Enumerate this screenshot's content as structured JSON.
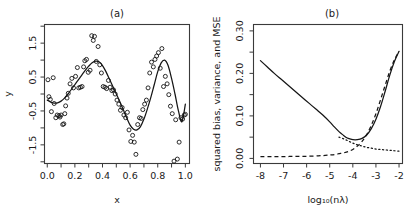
{
  "figure": {
    "panels": [
      {
        "id": "a",
        "title": "(a)",
        "xlabel": "x",
        "ylabel": "y"
      },
      {
        "id": "b",
        "title": "(b)",
        "xlabel": "log₁₀(nλ)",
        "ylabel": "squared bias, variance, and MSE"
      }
    ]
  },
  "chart_data": [
    {
      "type": "scatter",
      "panel": "a",
      "title": "(a)",
      "xlabel": "x",
      "ylabel": "y",
      "xlim": [
        -0.02,
        1.03
      ],
      "ylim": [
        -2.05,
        2.05
      ],
      "xticks": [
        0.0,
        0.2,
        0.4,
        0.6,
        0.8,
        1.0
      ],
      "xtick_labels": [
        "0.0",
        "0.2",
        "0.4",
        "0.6",
        "0.8",
        "1.0"
      ],
      "xminor_ticks": [
        0.1,
        0.3,
        0.5,
        0.7,
        0.9
      ],
      "yticks": [
        -1.5,
        -0.5,
        0.5,
        1.5
      ],
      "ytick_labels": [
        "-1.5",
        "-0.5",
        "0.5",
        "1.5"
      ],
      "yminor_ticks": [
        -2.0,
        -1.0,
        0.0,
        1.0,
        2.0
      ],
      "grid": false,
      "legend": null,
      "series": [
        {
          "name": "observations",
          "type": "scatter",
          "marker": "open-circle",
          "x": [
            0.005,
            0.012,
            0.022,
            0.03,
            0.043,
            0.05,
            0.062,
            0.072,
            0.085,
            0.092,
            0.1,
            0.112,
            0.12,
            0.127,
            0.133,
            0.143,
            0.152,
            0.165,
            0.178,
            0.19,
            0.205,
            0.218,
            0.228,
            0.24,
            0.252,
            0.263,
            0.272,
            0.284,
            0.297,
            0.31,
            0.322,
            0.333,
            0.342,
            0.355,
            0.368,
            0.38,
            0.392,
            0.405,
            0.418,
            0.43,
            0.443,
            0.455,
            0.468,
            0.48,
            0.492,
            0.505,
            0.518,
            0.53,
            0.542,
            0.555,
            0.568,
            0.58,
            0.592,
            0.605,
            0.618,
            0.63,
            0.642,
            0.655,
            0.668,
            0.68,
            0.692,
            0.705,
            0.718,
            0.73,
            0.742,
            0.755,
            0.768,
            0.78,
            0.792,
            0.805,
            0.818,
            0.83,
            0.842,
            0.855,
            0.868,
            0.88,
            0.892,
            0.905,
            0.918,
            0.93,
            0.942,
            0.955,
            0.968,
            0.98,
            0.992,
            1.0
          ],
          "y": [
            0.42,
            -0.08,
            -0.16,
            -0.52,
            0.48,
            -0.28,
            -0.7,
            -0.62,
            -0.64,
            -0.68,
            -0.62,
            -0.9,
            -0.88,
            -0.58,
            -0.35,
            -0.12,
            0.02,
            0.3,
            0.46,
            0.18,
            0.52,
            0.78,
            0.18,
            0.2,
            0.22,
            0.8,
            0.98,
            1.02,
            0.64,
            0.7,
            1.72,
            1.58,
            1.7,
            0.96,
            1.4,
            0.86,
            0.62,
            0.22,
            0.2,
            0.16,
            0.4,
            0.2,
            0.1,
            0.12,
            0.0,
            -0.18,
            -0.3,
            -0.48,
            -0.4,
            -0.62,
            -0.7,
            -0.54,
            -1.06,
            -1.4,
            -1.22,
            -1.42,
            -1.78,
            -0.9,
            -0.7,
            -0.72,
            -0.46,
            -0.3,
            -0.18,
            0.18,
            0.62,
            0.94,
            0.8,
            1.02,
            1.12,
            1.22,
            0.76,
            1.34,
            0.22,
            0.52,
            0.3,
            -0.02,
            -0.36,
            -0.58,
            -1.98,
            -0.76,
            -1.92,
            -1.42,
            -0.7,
            -0.74,
            -0.62,
            -0.6
          ]
        },
        {
          "name": "smoothing-spline-fit",
          "type": "line",
          "style": "solid",
          "x": [
            0.0,
            0.025,
            0.05,
            0.075,
            0.1,
            0.125,
            0.15,
            0.175,
            0.2,
            0.225,
            0.25,
            0.275,
            0.3,
            0.325,
            0.35,
            0.375,
            0.4,
            0.425,
            0.45,
            0.475,
            0.5,
            0.525,
            0.55,
            0.575,
            0.6,
            0.625,
            0.65,
            0.675,
            0.7,
            0.725,
            0.75,
            0.775,
            0.8,
            0.825,
            0.85,
            0.875,
            0.9,
            0.925,
            0.95,
            0.975,
            1.0
          ],
          "y": [
            -0.18,
            -0.24,
            -0.27,
            -0.26,
            -0.21,
            -0.12,
            0.0,
            0.14,
            0.28,
            0.42,
            0.56,
            0.7,
            0.82,
            0.92,
            0.97,
            0.95,
            0.84,
            0.66,
            0.44,
            0.22,
            0.0,
            -0.22,
            -0.46,
            -0.7,
            -0.92,
            -1.04,
            -1.06,
            -0.96,
            -0.74,
            -0.44,
            -0.1,
            0.28,
            0.66,
            0.92,
            1.0,
            0.84,
            0.46,
            0.0,
            -0.5,
            -0.82,
            -0.3
          ]
        }
      ]
    },
    {
      "type": "line",
      "panel": "b",
      "title": "(b)",
      "xlabel": "log₁₀(nλ)",
      "ylabel": "squared bias, variance, and MSE",
      "xlim": [
        -8.3,
        -1.85
      ],
      "ylim": [
        -0.012,
        0.315
      ],
      "xticks": [
        -8,
        -7,
        -6,
        -5,
        -4,
        -3,
        -2
      ],
      "xtick_labels": [
        "-8",
        "-7",
        "-6",
        "-5",
        "-4",
        "-3",
        "-2"
      ],
      "yticks": [
        0.0,
        0.1,
        0.2,
        0.3
      ],
      "ytick_labels": [
        "0.00",
        "0.10",
        "0.20",
        "0.30"
      ],
      "yminor_ticks": [
        0.05,
        0.15,
        0.25
      ],
      "grid": false,
      "legend": null,
      "series": [
        {
          "name": "MSE",
          "style": "solid",
          "x": [
            -8.0,
            -7.7,
            -7.4,
            -7.1,
            -6.8,
            -6.5,
            -6.2,
            -5.9,
            -5.6,
            -5.3,
            -5.0,
            -4.8,
            -4.6,
            -4.4,
            -4.3,
            -4.2,
            -4.0,
            -3.8,
            -3.6,
            -3.4,
            -3.2,
            -3.0,
            -2.8,
            -2.6,
            -2.4,
            -2.2,
            -2.0
          ],
          "y": [
            0.23,
            0.215,
            0.2,
            0.186,
            0.172,
            0.158,
            0.144,
            0.13,
            0.116,
            0.102,
            0.086,
            0.074,
            0.063,
            0.054,
            0.05,
            0.047,
            0.044,
            0.044,
            0.047,
            0.055,
            0.07,
            0.092,
            0.122,
            0.158,
            0.196,
            0.228,
            0.252
          ]
        },
        {
          "name": "squared bias",
          "style": "dashed",
          "x": [
            -8.0,
            -7.5,
            -7.0,
            -6.5,
            -6.0,
            -5.5,
            -5.2,
            -5.0,
            -4.8,
            -4.6,
            -4.4,
            -4.2,
            -4.0,
            -3.8,
            -3.6,
            -3.4,
            -3.2,
            -3.0,
            -2.8,
            -2.6,
            -2.4,
            -2.2,
            -2.0
          ],
          "y": [
            0.004,
            0.004,
            0.004,
            0.005,
            0.005,
            0.006,
            0.007,
            0.008,
            0.009,
            0.011,
            0.013,
            0.016,
            0.021,
            0.029,
            0.04,
            0.056,
            0.078,
            0.105,
            0.138,
            0.172,
            0.205,
            0.232,
            0.252
          ]
        },
        {
          "name": "variance",
          "style": "dotted",
          "x": [
            -4.6,
            -4.4,
            -4.2,
            -4.0,
            -3.8,
            -3.6,
            -3.4,
            -3.2,
            -3.0,
            -2.8,
            -2.6,
            -2.4,
            -2.2,
            -2.0
          ],
          "y": [
            0.05,
            0.046,
            0.041,
            0.036,
            0.032,
            0.029,
            0.026,
            0.024,
            0.022,
            0.021,
            0.02,
            0.019,
            0.018,
            0.017
          ]
        }
      ]
    }
  ]
}
